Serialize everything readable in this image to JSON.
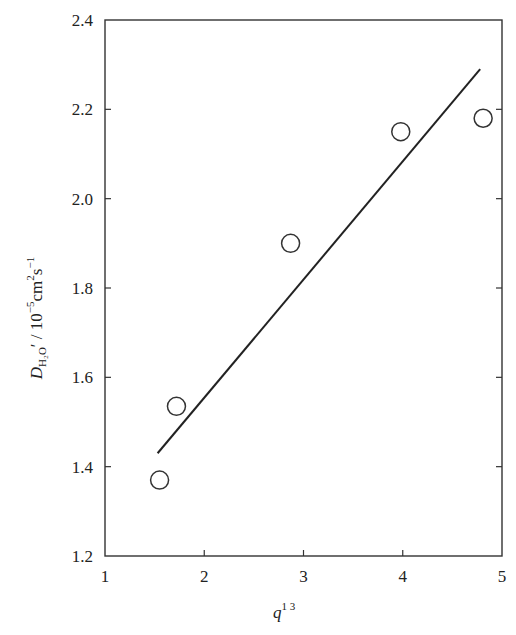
{
  "chart_data": {
    "type": "scatter",
    "title": "",
    "xlabel": "q^1/3",
    "ylabel": "D_H2O' / 10^-5 cm^2 s^-1",
    "xlim": [
      1,
      5
    ],
    "ylim": [
      1.2,
      2.4
    ],
    "x_ticks": [
      1,
      2,
      3,
      4,
      5
    ],
    "y_ticks": [
      1.2,
      1.4,
      1.6,
      1.8,
      2.0,
      2.2,
      2.4
    ],
    "x_tick_labels": [
      "1",
      "2",
      "3",
      "4",
      "5"
    ],
    "y_tick_labels": [
      "1.2",
      "1.4",
      "1.6",
      "1.8",
      "2.0",
      "2.2",
      "2.4"
    ],
    "grid": false,
    "legend": null,
    "series": [
      {
        "name": "measured",
        "marker": "open-circle",
        "x": [
          1.55,
          1.72,
          2.87,
          3.98,
          4.81
        ],
        "y": [
          1.37,
          1.535,
          1.9,
          2.15,
          2.18
        ]
      },
      {
        "name": "linear fit",
        "style": "line",
        "x": [
          1.53,
          4.78
        ],
        "y": [
          1.43,
          2.29
        ]
      }
    ]
  },
  "labels": {
    "x_axis": {
      "base": "q",
      "sup": "1 3"
    },
    "y_axis": {
      "D": "D",
      "sub": "H₂O",
      "prime": "′",
      "rest": " / 10",
      "exp1": "−5",
      "unit1": "cm",
      "exp2": "2",
      "unit2": "s",
      "exp3": "−1"
    }
  }
}
